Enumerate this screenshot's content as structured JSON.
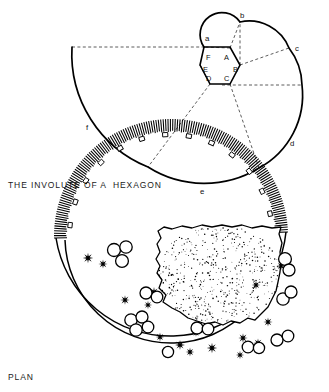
{
  "figure": {
    "involute": {
      "caption": "THE INVOLUTE OF A  HEXAGON",
      "hexagon_vertex_labels": [
        "A",
        "B",
        "C",
        "D",
        "E",
        "F"
      ],
      "curve_point_labels": [
        "a",
        "b",
        "c",
        "d",
        "e",
        "f"
      ],
      "label_positions": {
        "A": {
          "x": 226,
          "y": 57
        },
        "B": {
          "x": 237,
          "y": 70
        },
        "C": {
          "x": 226,
          "y": 82
        },
        "D": {
          "x": 207,
          "y": 82
        },
        "E": {
          "x": 203,
          "y": 70
        },
        "F": {
          "x": 207,
          "y": 57
        },
        "a": {
          "x": 207,
          "y": 39
        },
        "b": {
          "x": 243,
          "y": 16
        },
        "c": {
          "x": 297,
          "y": 49
        },
        "d": {
          "x": 292,
          "y": 143
        },
        "e": {
          "x": 202,
          "y": 192
        },
        "f": {
          "x": 88,
          "y": 127
        }
      },
      "hexagon_geometry": {
        "center_x": 220,
        "center_y": 65,
        "circumradius": 20,
        "orientation": "flat-top"
      }
    },
    "plan": {
      "caption": "PLAN",
      "description_elements": [
        "hatched-crescent-wall",
        "stippled-central-blob",
        "star-clusters",
        "ring-clusters"
      ]
    }
  },
  "colors": {
    "ink": "#000000",
    "construction": "#333333",
    "paper": "#ffffff"
  }
}
